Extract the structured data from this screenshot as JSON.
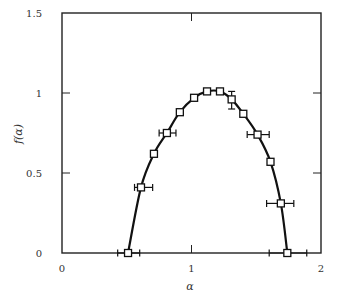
{
  "chart_data": {
    "type": "line",
    "title": "",
    "xlabel": "α",
    "ylabel": "f(α)",
    "xlim": [
      0,
      2
    ],
    "ylim": [
      0,
      1.5
    ],
    "grid": false,
    "legend": null,
    "x_ticks": [
      0,
      1,
      2
    ],
    "x_tick_labels": [
      "0",
      "1",
      "2"
    ],
    "y_ticks": [
      0,
      0.5,
      1,
      1.5
    ],
    "y_tick_labels": [
      "0",
      "0.5",
      "1",
      "1.5"
    ],
    "marker": "open-square",
    "curve": "smooth solid black line through points",
    "series": [
      {
        "name": "f(α) spectrum",
        "x": [
          0.51,
          0.61,
          0.71,
          0.81,
          0.91,
          1.02,
          1.12,
          1.22,
          1.31,
          1.4,
          1.51,
          1.61,
          1.69,
          1.74
        ],
        "y": [
          0.0,
          0.41,
          0.62,
          0.75,
          0.88,
          0.97,
          1.01,
          1.01,
          0.96,
          0.87,
          0.74,
          0.57,
          0.31,
          0.0
        ],
        "x_error_bars": [
          {
            "index": 0,
            "low": 0.43,
            "high": 0.6
          },
          {
            "index": 1,
            "low": 0.56,
            "high": 0.7
          },
          {
            "index": 3,
            "low": 0.75,
            "high": 0.88
          },
          {
            "index": 10,
            "low": 1.43,
            "high": 1.6
          },
          {
            "index": 12,
            "low": 1.58,
            "high": 1.79
          },
          {
            "index": 13,
            "low": 1.6,
            "high": 1.89
          }
        ],
        "y_error_bars": [
          {
            "index": 8,
            "low": 0.9,
            "high": 1.01
          }
        ]
      }
    ]
  }
}
